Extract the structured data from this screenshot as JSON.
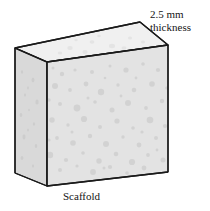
{
  "figure": {
    "caption": "Scaffold",
    "annotation": {
      "line1": "2.5 mm",
      "line2": "thickness",
      "value": "2.5",
      "unit": "mm",
      "measures": "thickness"
    },
    "colors": {
      "outline": "#1a1a1a",
      "front_face": "#e3e3e3",
      "left_face": "#d9d9d9",
      "top_face": "#f0f0f0",
      "pore_front": "#cfcfcf",
      "pore_left": "#c9c9c9",
      "pore_top": "#e2e2e2",
      "background": "#ffffff",
      "text": "#141414"
    },
    "geometry": {
      "back_top_apex": [
        140,
        22
      ],
      "top_left": [
        15,
        48
      ],
      "top_right": [
        168,
        45
      ],
      "front_top_left": [
        47,
        62
      ],
      "bottom_left": [
        15,
        173
      ],
      "front_bottom_left": [
        47,
        186
      ],
      "bottom_right": [
        168,
        172
      ]
    },
    "pores_front": [
      [
        62,
        74,
        2.2
      ],
      [
        75,
        70,
        1.6
      ],
      [
        92,
        72,
        2.0
      ],
      [
        110,
        66,
        1.5
      ],
      [
        126,
        70,
        2.6
      ],
      [
        143,
        64,
        1.8
      ],
      [
        158,
        70,
        2.1
      ],
      [
        55,
        86,
        3.0
      ],
      [
        70,
        90,
        1.9
      ],
      [
        86,
        84,
        2.4
      ],
      [
        101,
        92,
        3.2
      ],
      [
        118,
        85,
        1.7
      ],
      [
        134,
        90,
        2.3
      ],
      [
        152,
        84,
        2.8
      ],
      [
        60,
        104,
        2.0
      ],
      [
        77,
        108,
        3.4
      ],
      [
        95,
        102,
        1.8
      ],
      [
        112,
        110,
        2.5
      ],
      [
        128,
        103,
        3.0
      ],
      [
        146,
        108,
        1.9
      ],
      [
        162,
        101,
        2.2
      ],
      [
        52,
        120,
        2.7
      ],
      [
        68,
        125,
        1.7
      ],
      [
        84,
        119,
        3.1
      ],
      [
        100,
        127,
        2.0
      ],
      [
        117,
        121,
        2.6
      ],
      [
        133,
        128,
        1.8
      ],
      [
        150,
        120,
        3.3
      ],
      [
        57,
        138,
        1.9
      ],
      [
        73,
        143,
        2.8
      ],
      [
        90,
        136,
        2.2
      ],
      [
        106,
        144,
        3.0
      ],
      [
        123,
        137,
        1.7
      ],
      [
        139,
        145,
        2.4
      ],
      [
        156,
        138,
        2.0
      ],
      [
        50,
        155,
        3.2
      ],
      [
        66,
        160,
        2.1
      ],
      [
        83,
        153,
        1.8
      ],
      [
        99,
        161,
        2.7
      ],
      [
        116,
        154,
        2.3
      ],
      [
        132,
        162,
        3.1
      ],
      [
        148,
        155,
        1.9
      ],
      [
        163,
        160,
        2.5
      ],
      [
        60,
        170,
        2.0
      ],
      [
        77,
        166,
        1.6
      ],
      [
        93,
        172,
        2.9
      ],
      [
        110,
        167,
        2.1
      ],
      [
        127,
        173,
        1.8
      ],
      [
        144,
        168,
        2.4
      ],
      [
        160,
        174,
        2.0
      ],
      [
        53,
        68,
        1.5
      ],
      [
        167,
        88,
        1.8
      ],
      [
        165,
        126,
        2.1
      ],
      [
        49,
        100,
        1.7
      ],
      [
        49,
        140,
        1.6
      ],
      [
        136,
        78,
        1.4
      ],
      [
        105,
        78,
        1.3
      ],
      [
        88,
        98,
        1.5
      ],
      [
        121,
        96,
        1.4
      ],
      [
        72,
        132,
        1.5
      ],
      [
        142,
        132,
        1.6
      ],
      [
        157,
        150,
        1.4
      ],
      [
        104,
        168,
        1.5
      ]
    ],
    "pores_left": [
      [
        22,
        72,
        1.8
      ],
      [
        33,
        80,
        2.2
      ],
      [
        25,
        95,
        1.6
      ],
      [
        37,
        102,
        2.5
      ],
      [
        21,
        115,
        2.0
      ],
      [
        34,
        124,
        1.7
      ],
      [
        24,
        137,
        2.4
      ],
      [
        36,
        146,
        1.9
      ],
      [
        22,
        158,
        2.1
      ],
      [
        33,
        166,
        1.6
      ],
      [
        28,
        88,
        1.4
      ],
      [
        28,
        130,
        1.5
      ],
      [
        29,
        110,
        1.3
      ]
    ],
    "pores_top": [
      [
        70,
        48,
        2.0
      ],
      [
        92,
        42,
        1.7
      ],
      [
        112,
        46,
        2.2
      ],
      [
        130,
        38,
        1.5
      ],
      [
        60,
        53,
        1.6
      ],
      [
        85,
        52,
        1.9
      ],
      [
        108,
        54,
        1.4
      ],
      [
        124,
        48,
        1.8
      ],
      [
        143,
        42,
        1.5
      ],
      [
        152,
        50,
        1.7
      ],
      [
        99,
        36,
        1.3
      ],
      [
        76,
        40,
        1.2
      ]
    ]
  }
}
